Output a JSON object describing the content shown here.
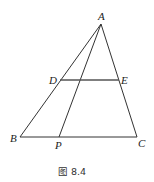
{
  "figure": {
    "caption": "图 8.4",
    "points": {
      "A": {
        "label": "A",
        "x": 101,
        "y": 24
      },
      "B": {
        "label": "B",
        "x": 20,
        "y": 137
      },
      "C": {
        "label": "C",
        "x": 137,
        "y": 137
      },
      "D": {
        "label": "D",
        "x": 60,
        "y": 80
      },
      "E": {
        "label": "E",
        "x": 119,
        "y": 80
      },
      "P": {
        "label": "P",
        "x": 59,
        "y": 137
      }
    },
    "segments": [
      "AB",
      "AC",
      "BC",
      "AP",
      "DE"
    ],
    "line_color": "#333333"
  }
}
